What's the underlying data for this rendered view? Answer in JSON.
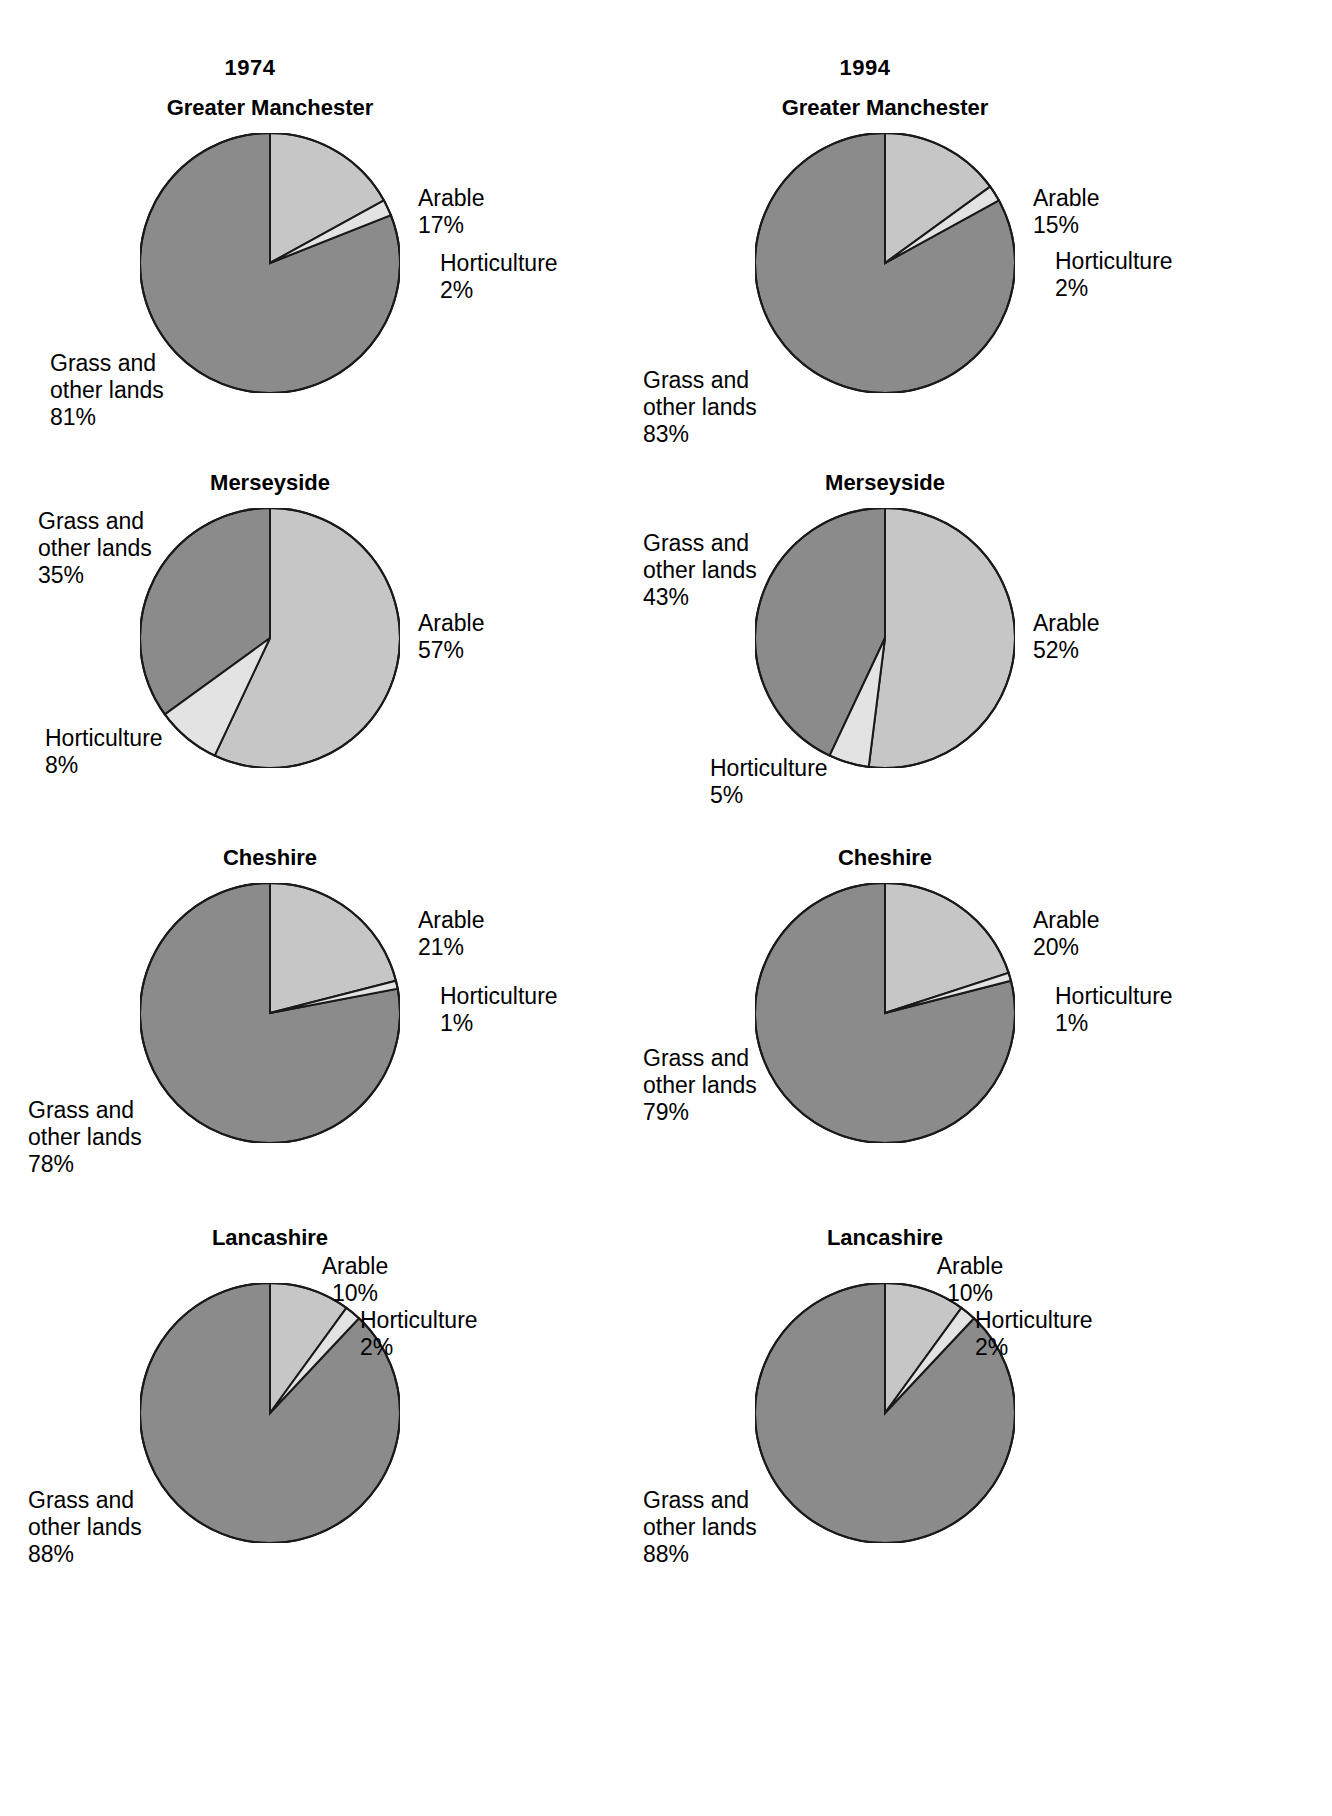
{
  "columns": [
    {
      "year_label": "1974"
    },
    {
      "year_label": "1994"
    }
  ],
  "legend_terms": {
    "arable": "Arable",
    "horticulture": "Horticulture",
    "grass": "Grass and\nother lands"
  },
  "colors": {
    "arable": "#c6c6c6",
    "horticulture": "#e3e3e3",
    "grass": "#8b8b8b",
    "outline": "#1a1a1a",
    "text": "#000000",
    "background": "#ffffff"
  },
  "chart_data": [
    {
      "type": "pie",
      "title": "Greater Manchester",
      "year": "1974",
      "categories": [
        "Arable",
        "Horticulture",
        "Grass and other lands"
      ],
      "values": [
        17,
        2,
        81
      ],
      "labels": [
        "Arable\n17%",
        "Horticulture\n2%",
        "Grass and\nother lands\n81%"
      ],
      "start_angle_deg": 0,
      "direction": "clockwise",
      "legend": "callout labels"
    },
    {
      "type": "pie",
      "title": "Merseyside",
      "year": "1974",
      "categories": [
        "Arable",
        "Horticulture",
        "Grass and other lands"
      ],
      "values": [
        57,
        8,
        35
      ],
      "labels": [
        "Arable\n57%",
        "Horticulture\n8%",
        "Grass and\nother lands\n35%"
      ],
      "start_angle_deg": 0,
      "direction": "clockwise",
      "legend": "callout labels"
    },
    {
      "type": "pie",
      "title": "Cheshire",
      "year": "1974",
      "categories": [
        "Arable",
        "Horticulture",
        "Grass and other lands"
      ],
      "values": [
        21,
        1,
        78
      ],
      "labels": [
        "Arable\n21%",
        "Horticulture\n1%",
        "Grass and\nother lands\n78%"
      ],
      "start_angle_deg": 0,
      "direction": "clockwise",
      "legend": "callout labels"
    },
    {
      "type": "pie",
      "title": "Lancashire",
      "year": "1974",
      "categories": [
        "Arable",
        "Horticulture",
        "Grass and other lands"
      ],
      "values": [
        10,
        2,
        88
      ],
      "labels": [
        "Arable\n10%",
        "Horticulture\n2%",
        "Grass and\nother lands\n88%"
      ],
      "start_angle_deg": 0,
      "direction": "clockwise",
      "legend": "callout labels"
    },
    {
      "type": "pie",
      "title": "Greater Manchester",
      "year": "1994",
      "categories": [
        "Arable",
        "Horticulture",
        "Grass and other lands"
      ],
      "values": [
        15,
        2,
        83
      ],
      "labels": [
        "Arable\n15%",
        "Horticulture\n2%",
        "Grass and\nother lands\n83%"
      ],
      "start_angle_deg": 0,
      "direction": "clockwise",
      "legend": "callout labels"
    },
    {
      "type": "pie",
      "title": "Merseyside",
      "year": "1994",
      "categories": [
        "Arable",
        "Horticulture",
        "Grass and other lands"
      ],
      "values": [
        52,
        5,
        43
      ],
      "labels": [
        "Arable\n52%",
        "Horticulture\n5%",
        "Grass and\nother lands\n43%"
      ],
      "start_angle_deg": 0,
      "direction": "clockwise",
      "legend": "callout labels"
    },
    {
      "type": "pie",
      "title": "Cheshire",
      "year": "1994",
      "categories": [
        "Arable",
        "Horticulture",
        "Grass and other lands"
      ],
      "values": [
        20,
        1,
        79
      ],
      "labels": [
        "Arable\n20%",
        "Horticulture\n1%",
        "Grass and\nother lands\n79%"
      ],
      "start_angle_deg": 0,
      "direction": "clockwise",
      "legend": "callout labels"
    },
    {
      "type": "pie",
      "title": "Lancashire",
      "year": "1994",
      "categories": [
        "Arable",
        "Horticulture",
        "Grass and other lands"
      ],
      "values": [
        10,
        2,
        88
      ],
      "labels": [
        "Arable\n10%",
        "Horticulture\n2%",
        "Grass and\nother lands\n88%"
      ],
      "start_angle_deg": 0,
      "direction": "clockwise",
      "legend": "callout labels"
    }
  ],
  "panels": {
    "gm74": {
      "title": "Greater Manchester",
      "arable_label": "Arable\n17%",
      "horticulture_label": "Horticulture\n2%",
      "grass_label": "Grass and\nother lands\n81%"
    },
    "mers74": {
      "title": "Merseyside",
      "arable_label": "Arable\n57%",
      "horticulture_label": "Horticulture\n8%",
      "grass_label": "Grass and\nother lands\n35%"
    },
    "ches74": {
      "title": "Cheshire",
      "arable_label": "Arable\n21%",
      "horticulture_label": "Horticulture\n1%",
      "grass_label": "Grass and\nother lands\n78%"
    },
    "lanc74": {
      "title": "Lancashire",
      "arable_label": "Arable\n10%",
      "horticulture_label": "Horticulture\n2%",
      "grass_label": "Grass and\nother lands\n88%"
    },
    "gm94": {
      "title": "Greater Manchester",
      "arable_label": "Arable\n15%",
      "horticulture_label": "Horticulture\n2%",
      "grass_label": "Grass and\nother lands\n83%"
    },
    "mers94": {
      "title": "Merseyside",
      "arable_label": "Arable\n52%",
      "horticulture_label": "Horticulture\n5%",
      "grass_label": "Grass and\nother lands\n43%"
    },
    "ches94": {
      "title": "Cheshire",
      "arable_label": "Arable\n20%",
      "horticulture_label": "Horticulture\n1%",
      "grass_label": "Grass and\nother lands\n79%"
    },
    "lanc94": {
      "title": "Lancashire",
      "arable_label": "Arable\n10%",
      "horticulture_label": "Horticulture\n2%",
      "grass_label": "Grass and\nother lands\n88%"
    }
  }
}
